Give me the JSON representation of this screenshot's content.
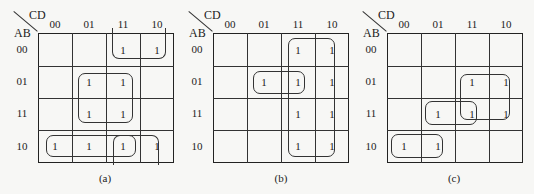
{
  "figure": {
    "col_var": "CD",
    "row_var": "AB",
    "col_headers": [
      "00",
      "01",
      "11",
      "10"
    ],
    "row_headers": [
      "00",
      "01",
      "11",
      "10"
    ],
    "maps": [
      {
        "caption": "(a)",
        "cells": [
          [
            "",
            "",
            "1",
            "1"
          ],
          [
            "",
            "1",
            "1",
            ""
          ],
          [
            "",
            "1",
            "1",
            ""
          ],
          [
            "1",
            "1",
            "1",
            "1"
          ]
        ]
      },
      {
        "caption": "(b)",
        "cells": [
          [
            "",
            "",
            "1",
            "1"
          ],
          [
            "",
            "1",
            "1",
            "1"
          ],
          [
            "",
            "",
            "1",
            "1"
          ],
          [
            "",
            "",
            "1",
            "1"
          ]
        ]
      },
      {
        "caption": "(c)",
        "cells": [
          [
            "",
            "",
            "",
            ""
          ],
          [
            "",
            "",
            "1",
            "1"
          ],
          [
            "",
            "1",
            "1",
            "1"
          ],
          [
            "1",
            "1",
            "",
            ""
          ]
        ]
      }
    ]
  }
}
